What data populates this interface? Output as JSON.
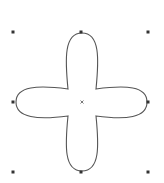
{
  "canvas": {
    "width": 164,
    "height": 183,
    "background": "#ffffff"
  },
  "shape": {
    "type": "four-petal-flower",
    "stroke": "#555555",
    "fill": "none",
    "center": [
      82,
      102
    ],
    "top_tip": [
      82,
      33
    ],
    "bottom_tip": [
      82,
      171
    ],
    "left_tip": [
      16,
      102
    ],
    "right_tip": [
      147,
      102
    ],
    "inner_junctions": [
      [
        68,
        89
      ],
      [
        96,
        89
      ],
      [
        96,
        116
      ],
      [
        68,
        116
      ]
    ]
  },
  "selection": {
    "handle_color": "#333333",
    "handle_size": 3,
    "handles": [
      {
        "name": "top-left",
        "x": 13,
        "y": 32
      },
      {
        "name": "top-center",
        "x": 81,
        "y": 32
      },
      {
        "name": "top-right",
        "x": 148,
        "y": 32
      },
      {
        "name": "middle-left",
        "x": 13,
        "y": 102
      },
      {
        "name": "middle-right",
        "x": 148,
        "y": 102
      },
      {
        "name": "bottom-left",
        "x": 13,
        "y": 172
      },
      {
        "name": "bottom-center",
        "x": 81,
        "y": 172
      },
      {
        "name": "bottom-right",
        "x": 148,
        "y": 172
      }
    ],
    "center_marker": {
      "x": 82,
      "y": 102,
      "glyph": "×"
    }
  }
}
